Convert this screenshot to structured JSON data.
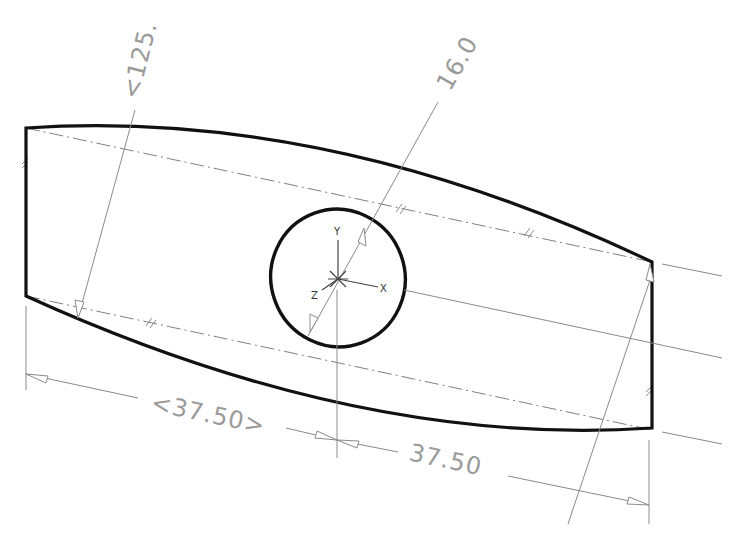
{
  "drawing": {
    "type": "cad-sketch",
    "colors": {
      "outline": "#111111",
      "dimension": "#8a8a8a",
      "dimension_text": "#9a9a9a",
      "centerline": "#808080",
      "background": "#ffffff"
    },
    "dimensions": {
      "radius_label": "<125.",
      "diameter_label": "16.0",
      "left_width_label": "<37.50>",
      "right_width_label": "37.50"
    },
    "axes": {
      "x_label": "X",
      "y_label": "Y",
      "z_label": "Z"
    }
  }
}
